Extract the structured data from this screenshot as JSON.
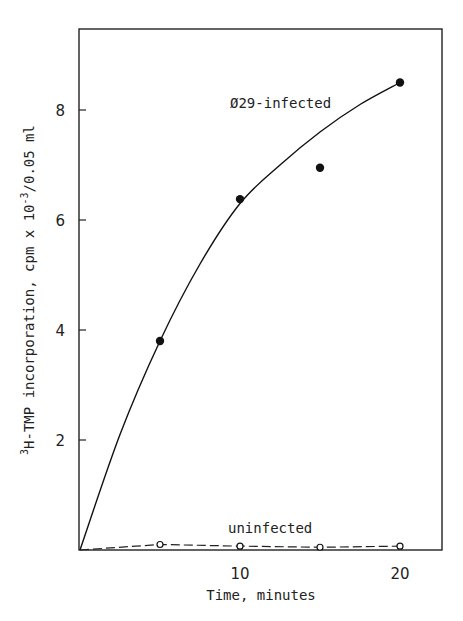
{
  "chart_data": {
    "type": "scatter",
    "title": "",
    "xlabel": "Time, minutes",
    "ylabel_prefix": "3",
    "ylabel": "H-TMP incorporation, cpm x 10",
    "ylabel_exp": "-3",
    "ylabel_suffix": "/0.05 ml",
    "xlim": [
      0,
      22.7
    ],
    "ylim": [
      0,
      9.5
    ],
    "x_ticks": [
      10,
      20
    ],
    "y_ticks": [
      2,
      4,
      6,
      8
    ],
    "grid": false,
    "series": [
      {
        "name": "Ø29-infected",
        "marker": "filled-circle",
        "line": "solid-fitted-curve",
        "x": [
          5,
          10,
          15,
          20
        ],
        "y": [
          3.8,
          6.38,
          6.95,
          8.5
        ],
        "curve_x": [
          0,
          2.5,
          5,
          7.5,
          10,
          12.5,
          15,
          17.5,
          20
        ],
        "curve_y": [
          0,
          2.1,
          3.8,
          5.2,
          6.3,
          7.0,
          7.6,
          8.1,
          8.5
        ]
      },
      {
        "name": "uninfected",
        "marker": "open-circle",
        "line": "dashed",
        "x": [
          0,
          5,
          10,
          15,
          20
        ],
        "y": [
          0,
          0.1,
          0.07,
          0.05,
          0.07
        ]
      }
    ],
    "annotations": [
      {
        "text": "Ø29-infected",
        "x": 9.5,
        "y": 8.0
      },
      {
        "text": "uninfected",
        "x": 9.5,
        "y": 0.3
      }
    ]
  }
}
